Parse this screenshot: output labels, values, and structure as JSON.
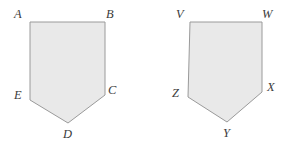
{
  "figure": {
    "background_color": "#ffffff",
    "shape_fill_color": "#e9e9e9",
    "shape_stroke_color": "#9a9a9a",
    "label_color": "#3b3b3b",
    "shapes": [
      {
        "name": "pentagon-abcde",
        "points": "30,22 105,22 105,95 68,123 30,100",
        "vertices": [
          {
            "label": "A",
            "x": 30,
            "y": 22,
            "label_x": 14,
            "label_y": 8
          },
          {
            "label": "B",
            "x": 105,
            "y": 22,
            "label_x": 106,
            "label_y": 8
          },
          {
            "label": "C",
            "x": 105,
            "y": 95,
            "label_x": 108,
            "label_y": 84
          },
          {
            "label": "D",
            "x": 68,
            "y": 123,
            "label_x": 63,
            "label_y": 128
          },
          {
            "label": "E",
            "x": 30,
            "y": 100,
            "label_x": 14,
            "label_y": 89
          }
        ]
      },
      {
        "name": "pentagon-vwxyz",
        "points": "190,22 262,22 262,92 227,122 188,97",
        "vertices": [
          {
            "label": "V",
            "x": 190,
            "y": 22,
            "label_x": 176,
            "label_y": 8
          },
          {
            "label": "W",
            "x": 262,
            "y": 22,
            "label_x": 262,
            "label_y": 8
          },
          {
            "label": "X",
            "x": 262,
            "y": 92,
            "label_x": 267,
            "label_y": 81
          },
          {
            "label": "Y",
            "x": 227,
            "y": 122,
            "label_x": 223,
            "label_y": 127
          },
          {
            "label": "Z",
            "x": 188,
            "y": 97,
            "label_x": 172,
            "label_y": 87
          }
        ]
      }
    ]
  }
}
